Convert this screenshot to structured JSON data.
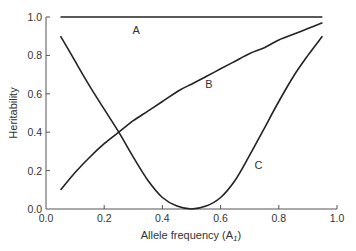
{
  "chart_data": {
    "type": "line",
    "title": "",
    "xlabel": "Allele frequency (A",
    "xlabel_subscript": "1",
    "xlabel_close": ")",
    "ylabel": "Heritability",
    "xlim": [
      0.0,
      1.0
    ],
    "ylim": [
      0.0,
      1.0
    ],
    "grid": false,
    "legend": "none (curves labeled inline)",
    "x_ticks": [
      "0.0",
      "0.2",
      "0.4",
      "0.6",
      "0.8",
      "1.0"
    ],
    "y_ticks": [
      "0.0",
      "0.2",
      "0.4",
      "0.6",
      "0.8",
      "1.0"
    ],
    "series": [
      {
        "name": "A",
        "label_pos": [
          0.31,
          0.93
        ],
        "x": [
          0.05,
          0.95
        ],
        "y": [
          1.0,
          1.0
        ]
      },
      {
        "name": "B",
        "label_pos": [
          0.56,
          0.65
        ],
        "x": [
          0.05,
          0.1,
          0.15,
          0.2,
          0.25,
          0.3,
          0.35,
          0.4,
          0.46,
          0.5,
          0.55,
          0.6,
          0.65,
          0.7,
          0.75,
          0.8,
          0.85,
          0.9,
          0.95
        ],
        "y": [
          0.1,
          0.19,
          0.27,
          0.34,
          0.4,
          0.46,
          0.51,
          0.56,
          0.62,
          0.65,
          0.69,
          0.73,
          0.77,
          0.81,
          0.84,
          0.88,
          0.91,
          0.94,
          0.97
        ]
      },
      {
        "name": "C",
        "label_pos": [
          0.73,
          0.23
        ],
        "x": [
          0.05,
          0.1,
          0.15,
          0.2,
          0.25,
          0.3,
          0.35,
          0.4,
          0.45,
          0.5,
          0.55,
          0.6,
          0.65,
          0.7,
          0.75,
          0.8,
          0.85,
          0.9,
          0.95
        ],
        "y": [
          0.9,
          0.77,
          0.64,
          0.52,
          0.4,
          0.27,
          0.15,
          0.06,
          0.015,
          0.0,
          0.015,
          0.06,
          0.15,
          0.28,
          0.42,
          0.56,
          0.69,
          0.8,
          0.9
        ]
      }
    ]
  }
}
